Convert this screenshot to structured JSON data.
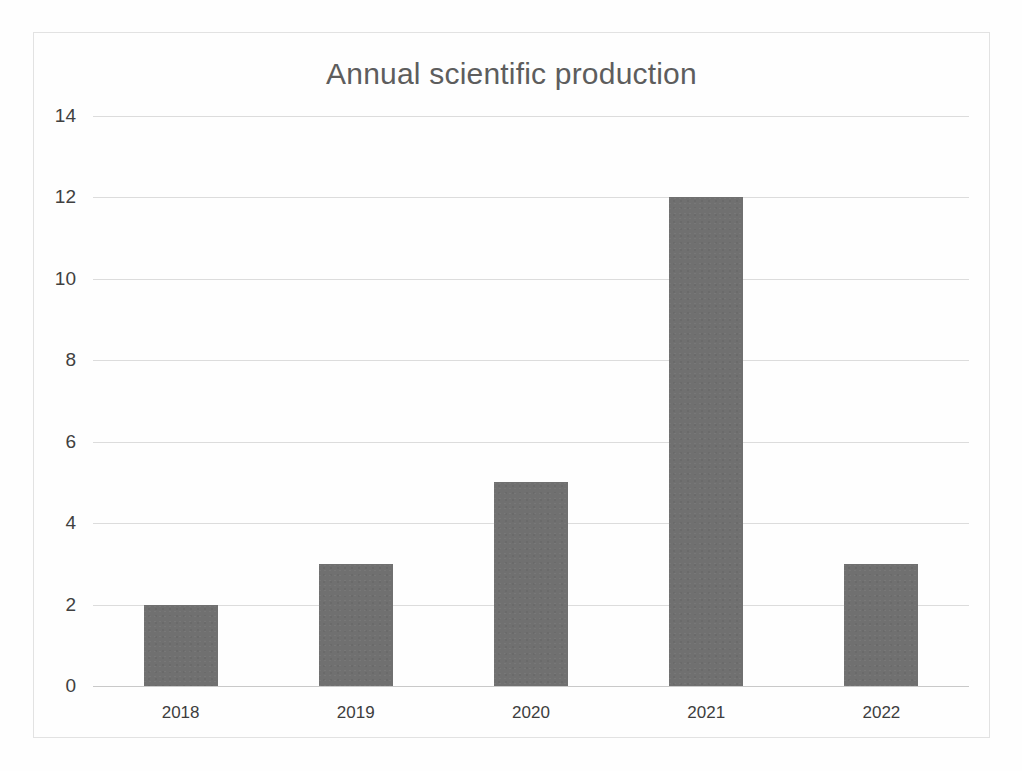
{
  "chart_data": {
    "type": "bar",
    "title": "Annual scientific production",
    "xlabel": "",
    "ylabel": "",
    "categories": [
      "2018",
      "2019",
      "2020",
      "2021",
      "2022"
    ],
    "values": [
      2,
      3,
      5,
      12,
      3
    ],
    "series": [
      {
        "name": "Annual scientific production",
        "values": [
          2,
          3,
          5,
          12,
          3
        ]
      }
    ],
    "ylim": [
      0,
      14
    ],
    "ytick_step": 2,
    "yticks": [
      0,
      2,
      4,
      6,
      8,
      10,
      12,
      14
    ],
    "ytick_labels": [
      "0",
      "2",
      "4",
      "6",
      "8",
      "10",
      "12",
      "14"
    ],
    "grid": true,
    "grid_axis": "y",
    "legend": false,
    "legend_position": "none",
    "bar_color": "#707070",
    "grid_color": "#dcdcdc",
    "title_color": "#5d5d5d",
    "tick_label_color": "#404040",
    "frame_border_color": "#e2e2e2",
    "background_color": "#fefefe"
  }
}
